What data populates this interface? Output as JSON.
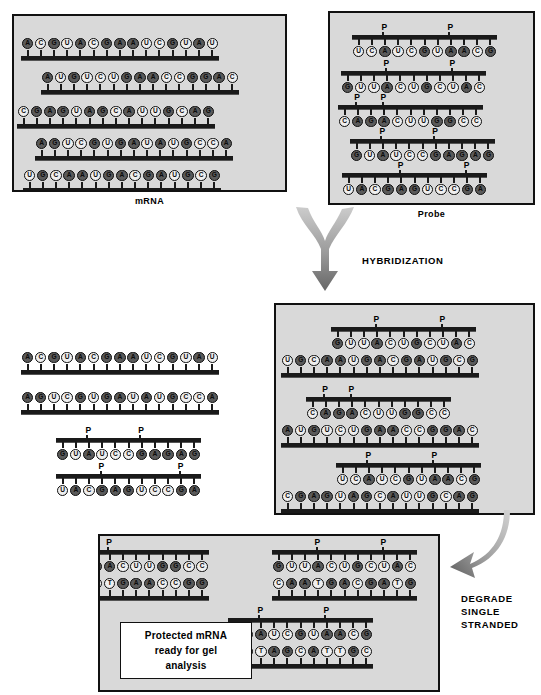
{
  "figure": {
    "colors": {
      "panel_fill": "#d9d9d9",
      "panel_border": "#111111",
      "purine_bead": "#5a5a5a",
      "pyrimidine_bead": "#efefef",
      "backbone": "#1a1a1a",
      "arrow": "#8a8a8a"
    }
  },
  "panels": {
    "mrna": {
      "label": "mRNA",
      "strands": [
        {
          "orientation": "up",
          "sequence": "ACGUACGAAUCGUAU",
          "phosphates": []
        },
        {
          "orientation": "up",
          "sequence": "AUGUCUGAACCGGAC",
          "phosphates": []
        },
        {
          "orientation": "up",
          "sequence": "CGAGUAGCAUUGCAG",
          "phosphates": []
        },
        {
          "orientation": "up",
          "sequence": "AGUCGUGAUAUGCCA",
          "phosphates": []
        },
        {
          "orientation": "up",
          "sequence": "UGCAAUGACGAUGCG",
          "phosphates": []
        }
      ]
    },
    "probe": {
      "label": "Probe",
      "strands": [
        {
          "orientation": "down",
          "sequence": "UCAUCGUAACG",
          "phosphates": [
            2,
            7
          ]
        },
        {
          "orientation": "down",
          "sequence": "GUUACUGCUAC",
          "phosphates": [
            3,
            8
          ]
        },
        {
          "orientation": "down",
          "sequence": "CAGACUUGGCC",
          "phosphates": [
            1,
            3
          ]
        },
        {
          "orientation": "down",
          "sequence": "GUAUCCGAGAG",
          "phosphates": [
            2,
            6
          ]
        },
        {
          "orientation": "down",
          "sequence": "UACGAGUCCGA",
          "phosphates": [
            4,
            9
          ]
        }
      ]
    },
    "unhybridized": {
      "label": "",
      "strands": [
        {
          "orientation": "up",
          "sequence": "ACGUACGAAUCGUAU",
          "phosphates": []
        },
        {
          "orientation": "up",
          "sequence": "AGUCGUGAUAUGCCA",
          "phosphates": []
        },
        {
          "orientation": "down",
          "sequence": "GUAUCCGAGAG",
          "phosphates": [
            2,
            6
          ]
        },
        {
          "orientation": "down",
          "sequence": "UACGAGUCCGA",
          "phosphates": [
            3,
            9
          ]
        }
      ]
    },
    "hybrids": {
      "label": "",
      "duplexes": [
        {
          "probe": {
            "sequence": "GUUACUGCUAC",
            "phosphates": [
              3,
              8
            ]
          },
          "mrna": {
            "sequence": "UGCAAUGACGAUGCG"
          }
        },
        {
          "probe": {
            "sequence": "CAGACUUGGCC",
            "phosphates": [
              1,
              3
            ]
          },
          "mrna": {
            "sequence": "AUGUCUGAACCGGAC"
          }
        },
        {
          "probe": {
            "sequence": "UCAUCGUAACG",
            "phosphates": [
              2,
              7
            ]
          },
          "mrna": {
            "sequence": "CGAGUAGCAUUGCAG"
          }
        }
      ]
    },
    "protected": {
      "note": "Protected mRNA ready for gel analysis",
      "note_lines": [
        "Protected mRNA",
        "ready for gel",
        "analysis"
      ],
      "duplexes": [
        {
          "probe": {
            "sequence": "GACUUGGCC",
            "phosphates": [
              1
            ]
          },
          "mrna": {
            "sequence": "CTGAACCGG"
          }
        },
        {
          "probe": {
            "sequence": "GUUACUGCUAC",
            "phosphates": [
              3,
              8
            ]
          },
          "mrna": {
            "sequence": "CAATGACGATG"
          }
        },
        {
          "probe": {
            "sequence": "UCAUCGUAACG",
            "phosphates": [
              2,
              7
            ]
          },
          "mrna": {
            "sequence": "AGTAGCATTGC"
          }
        }
      ]
    }
  },
  "steps": {
    "hybridization": "HYBRIDIZATION",
    "degrade": "DEGRADE\nSINGLE\nSTRANDED",
    "degrade_lines": [
      "DEGRADE",
      "SINGLE",
      "STRANDED"
    ]
  },
  "glyphs": {
    "phosphate": "P"
  }
}
